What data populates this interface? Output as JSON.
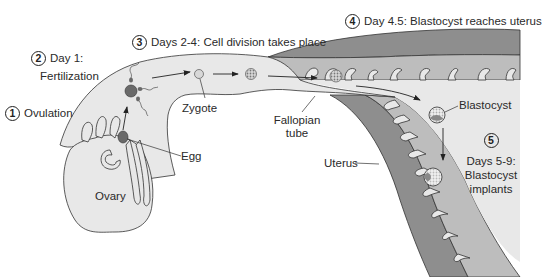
{
  "steps": [
    {
      "number": "1",
      "label": "Ovulation"
    },
    {
      "number": "2",
      "label": "Day 1:",
      "label2": "Fertilization"
    },
    {
      "number": "3",
      "label": "Days 2-4: Cell division takes place"
    },
    {
      "number": "4",
      "label": "Day 4.5: Blastocyst reaches uterus"
    },
    {
      "number": "5",
      "label": "Days 5-9:",
      "label2": "Blastocyst",
      "label3": "implants"
    }
  ],
  "structures": {
    "ovary": "Ovary",
    "egg": "Egg",
    "zygote": "Zygote",
    "fallopian_tube_line1": "Fallopian",
    "fallopian_tube_line2": "tube",
    "uterus": "Uterus",
    "blastocyst": "Blastocyst"
  },
  "colors": {
    "tissue_light": "#e8e8e8",
    "endometrium": "#bdbdbd",
    "myometrium": "#8e8e8e",
    "cell_dark": "#6a6a6a",
    "outline": "#333333"
  }
}
